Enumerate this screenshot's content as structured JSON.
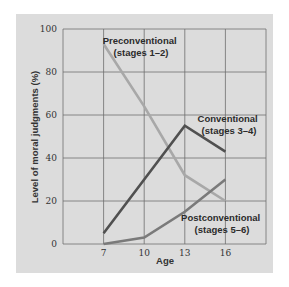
{
  "chart_data": {
    "type": "line",
    "title": "",
    "xlabel": "Age",
    "ylabel": "Level of moral judgments (%)",
    "x": [
      7,
      10,
      13,
      16
    ],
    "x_ticks": [
      "7",
      "10",
      "13",
      "16"
    ],
    "y_ticks": [
      "0",
      "20",
      "40",
      "60",
      "80",
      "100"
    ],
    "xlim": [
      4,
      19
    ],
    "ylim": [
      0,
      100
    ],
    "grid": true,
    "series": [
      {
        "name": "Preconventional (stages 1–2)",
        "label_line1": "Preconventional",
        "label_line2": "(stages 1–2)",
        "values": [
          93,
          64,
          32,
          20
        ],
        "color": "#a8a8a8"
      },
      {
        "name": "Conventional (stages 3–4)",
        "label_line1": "Conventional",
        "label_line2": "(stages 3–4)",
        "values": [
          5,
          30,
          55,
          43
        ],
        "color": "#505050"
      },
      {
        "name": "Postconventional (stages 5–6)",
        "label_line1": "Postconventional",
        "label_line2": "(stages 5–6)",
        "values": [
          0,
          3,
          15,
          30
        ],
        "color": "#7a7a7a"
      }
    ]
  }
}
